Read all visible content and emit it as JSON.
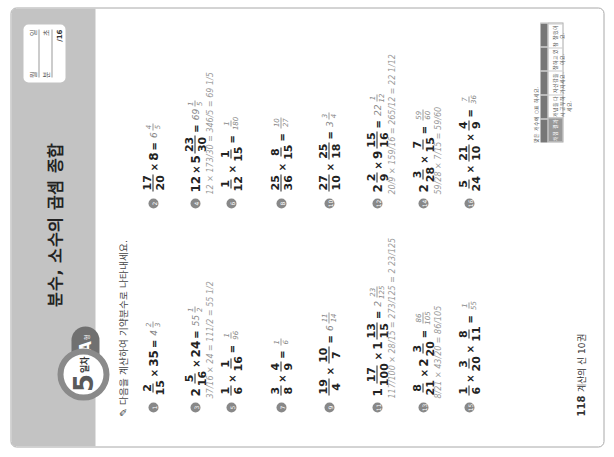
{
  "page": {
    "orientation": "rotated -90deg",
    "day_badge": {
      "number": "5",
      "label": "일차"
    },
    "type_tab": {
      "letter": "A",
      "suffix": "형"
    },
    "title": "분수, 소수의 곱셈 종합",
    "score_box": {
      "row1": [
        "월",
        "일"
      ],
      "row2": [
        "분",
        "초"
      ],
      "total": "/16"
    },
    "instruction": "다음을 계산하여 기약분수로 나타내세요.",
    "problems": [
      {
        "id": "1",
        "expr": [
          "2/15",
          "×",
          "35"
        ],
        "answer": "4 2/3"
      },
      {
        "id": "2",
        "expr": [
          "17/20",
          "×",
          "8"
        ],
        "answer": "6 4/5"
      },
      {
        "id": "3",
        "expr": [
          "2 5/16",
          "×",
          "24"
        ],
        "answer": "55 1/2",
        "work": "37/16 × 24 = 111/2 = 55 1/2"
      },
      {
        "id": "4",
        "expr": [
          "12",
          "×",
          "5 23/30"
        ],
        "answer": "69 1/5",
        "work": "12 × 173/30 = 346/5 = 69 1/5"
      },
      {
        "id": "5",
        "expr": [
          "1/6",
          "×",
          "1/16"
        ],
        "answer": "1/96"
      },
      {
        "id": "6",
        "expr": [
          "1/12",
          "×",
          "1/15"
        ],
        "answer": "1/180"
      },
      {
        "id": "7",
        "expr": [
          "3/8",
          "×",
          "4/9"
        ],
        "answer": "1/6"
      },
      {
        "id": "8",
        "expr": [
          "25/36",
          "×",
          "8/15"
        ],
        "answer": "10/27"
      },
      {
        "id": "9",
        "expr": [
          "19/4",
          "×",
          "10/7"
        ],
        "answer": "6 11/14"
      },
      {
        "id": "10",
        "expr": [
          "27/10",
          "×",
          "25/18"
        ],
        "answer": "3 3/4"
      },
      {
        "id": "11",
        "expr": [
          "1 17/100",
          "×",
          "1 13/15"
        ],
        "answer": "2 23/125",
        "work": "117/100 × 28/15 = 273/125 = 2 23/125"
      },
      {
        "id": "12",
        "expr": [
          "2 2/9",
          "×",
          "9 15/16"
        ],
        "answer": "22 1/12",
        "work": "20/9 × 159/16 = 265/12 = 22 1/12"
      },
      {
        "id": "13",
        "expr": [
          "8/21",
          "×",
          "2 3/20"
        ],
        "answer": "86/105",
        "work": "8/21 × 43/20 = 86/105"
      },
      {
        "id": "14",
        "expr": [
          "2 3/28",
          "×",
          "7/15"
        ],
        "answer": "59/60",
        "work": "59/28 × 7/15 = 59/60"
      },
      {
        "id": "15",
        "expr": [
          "1/6",
          "×",
          "3/20",
          "×",
          "8/11"
        ],
        "answer": "1/55"
      },
      {
        "id": "16",
        "expr": [
          "5/24",
          "×",
          "21/10",
          "×",
          "4/9"
        ],
        "answer": "7/36"
      }
    ],
    "footer": {
      "page_number": "118",
      "book": "계산의 신 10권"
    },
    "eval_table": {
      "caption": "맞은 개수에 ○표 하세요.",
      "cells": [
        "채점 결과",
        "개념을 다시 공부하세요.",
        "자신감을 가지세요.",
        "잘하고 있어요.",
        "참 잘했어요."
      ]
    }
  }
}
